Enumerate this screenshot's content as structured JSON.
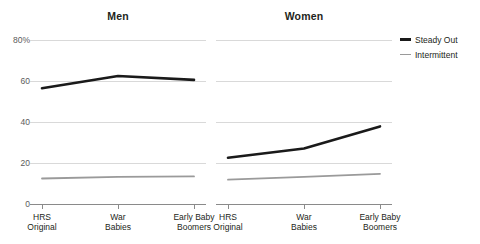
{
  "chart_data": {
    "type": "line",
    "title": "",
    "panels": [
      {
        "label": "Men",
        "series": [
          {
            "name": "Steady Out",
            "values": [
              56.2,
              62.2,
              60.3
            ]
          },
          {
            "name": "Intermittent",
            "values": [
              12.2,
              13.0,
              13.2
            ]
          }
        ]
      },
      {
        "label": "Women",
        "series": [
          {
            "name": "Steady Out",
            "values": [
              22.3,
              26.8,
              37.6
            ]
          },
          {
            "name": "Intermittent",
            "values": [
              11.6,
              13.0,
              14.5
            ]
          }
        ]
      }
    ],
    "categories": [
      "HRS\nOriginal",
      "War\nBabies",
      "Early Baby\nBoomers"
    ],
    "xlabel": "",
    "ylabel": "",
    "ylim": [
      0,
      80
    ],
    "yticks": [
      0,
      20,
      40,
      60,
      80
    ],
    "ytick_labels": [
      "0",
      "20",
      "40",
      "60",
      "80%"
    ],
    "grid": true,
    "legend_position": "right",
    "legend": [
      {
        "name": "Steady Out",
        "color": "#1a1a1a"
      },
      {
        "name": "Intermittent",
        "color": "#9a9a9a"
      }
    ],
    "colors": {
      "steady_out": "#1a1a1a",
      "intermittent": "#9a9a9a",
      "grid": "#d9d9d9",
      "axis": "#8a8a8a"
    }
  }
}
